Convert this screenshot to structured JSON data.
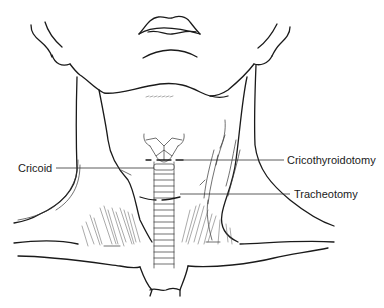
{
  "diagram": {
    "labels": {
      "cricoid": "Cricoid",
      "cricothyroidotomy": "Cricothyroidotomy",
      "tracheotomy": "Tracheotomy"
    },
    "colors": {
      "line": "#1a1a1a",
      "background": "#ffffff"
    }
  }
}
